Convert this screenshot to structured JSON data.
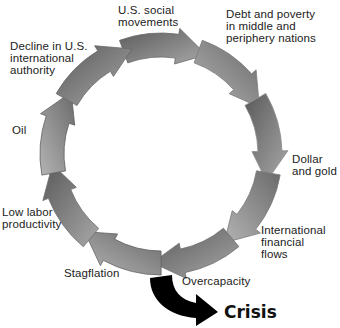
{
  "diagram": {
    "type": "cycle",
    "ring": {
      "cx": 161,
      "cy": 154,
      "outer_r": 121,
      "inner_r": 97,
      "direction": "clockwise"
    },
    "colors": {
      "ring_dark": "#555555",
      "ring_mid": "#8a8a8a",
      "ring_light": "#b5b5b5",
      "crisis_arrow": "#000000",
      "text": "#222222"
    },
    "nodes": [
      {
        "id": "us-social-movements",
        "label": "U.S. social\nmovements"
      },
      {
        "id": "debt-poverty",
        "label": "Debt and poverty\nin middle and\nperiphery nations"
      },
      {
        "id": "dollar-gold",
        "label": "Dollar\nand gold"
      },
      {
        "id": "international-financial-flows",
        "label": "International\nfinancial\nflows"
      },
      {
        "id": "overcapacity",
        "label": "Overcapacity"
      },
      {
        "id": "stagflation",
        "label": "Stagflation"
      },
      {
        "id": "low-labor-productivity",
        "label": "Low labor\nproductivity"
      },
      {
        "id": "oil",
        "label": "Oil"
      },
      {
        "id": "decline-us-authority",
        "label": "Decline in U.S.\ninternational\nauthority"
      }
    ],
    "outcome": {
      "label": "Crisis",
      "icon": "curved-arrow-down-right-icon"
    }
  }
}
